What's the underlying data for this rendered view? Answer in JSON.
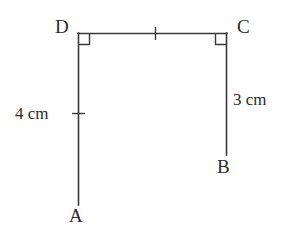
{
  "figure": {
    "background_color": "#ffffff",
    "stroke_color": "#3a3a3a",
    "text_color": "#2b2b2b"
  },
  "vertices": [
    {
      "id": "D",
      "label": "D",
      "x": 78,
      "y": 33
    },
    {
      "id": "C",
      "label": "C",
      "x": 227,
      "y": 33
    },
    {
      "id": "B",
      "label": "B",
      "x": 227,
      "y": 155
    },
    {
      "id": "A",
      "label": "A",
      "x": 78,
      "y": 205
    }
  ],
  "segments": [
    {
      "id": "DA",
      "from": "D",
      "to": "A",
      "orientation": "vertical"
    },
    {
      "id": "DC",
      "from": "D",
      "to": "C",
      "orientation": "horizontal"
    },
    {
      "id": "CB",
      "from": "C",
      "to": "B",
      "orientation": "vertical"
    }
  ],
  "right_angles": [
    {
      "at": "D",
      "size": 11
    },
    {
      "at": "C",
      "size": 11
    }
  ],
  "tick_marks": [
    {
      "id": "tick-dc",
      "on_segment": "DC",
      "x": 155,
      "y": 33,
      "orientation": "vertical"
    },
    {
      "id": "tick-da",
      "on_segment": "DA",
      "x": 78,
      "y": 113,
      "orientation": "horizontal"
    }
  ],
  "measurements": [
    {
      "id": "measure-4cm",
      "segment": "DA",
      "label": "4 cm"
    },
    {
      "id": "measure-3cm",
      "segment": "CB",
      "label": "3 cm"
    }
  ]
}
